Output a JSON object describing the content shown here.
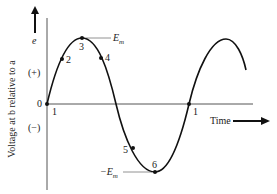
{
  "figure": {
    "y_axis_label": "Voltage at b relative to a",
    "y_axis_symbol": "e",
    "positive_label": "(+)",
    "negative_label": "(−)",
    "origin_label": "0",
    "x_axis_label": "Time",
    "max_label": "E",
    "max_sub": "m",
    "min_label": "−E",
    "min_sub": "m",
    "points": [
      {
        "id": "1a",
        "label": "1"
      },
      {
        "id": "2",
        "label": "2"
      },
      {
        "id": "3",
        "label": "3"
      },
      {
        "id": "4",
        "label": "4"
      },
      {
        "id": "5",
        "label": "5"
      },
      {
        "id": "6",
        "label": "6"
      },
      {
        "id": "1b",
        "label": "1"
      }
    ],
    "colors": {
      "ink": "#1a1a1a",
      "axis": "#555555"
    }
  }
}
